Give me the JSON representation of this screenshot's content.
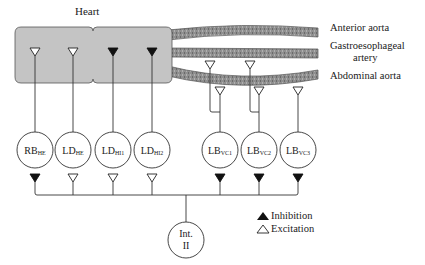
{
  "title": "Heart",
  "vessels": [
    {
      "name": "Anterior aorta",
      "y": 30
    },
    {
      "name": "Gastroesophageal",
      "name2": "artery",
      "y": 52
    },
    {
      "name": "Abdominal aorta",
      "y": 75
    }
  ],
  "heart_synapses": [
    {
      "x": 35,
      "type": "excitation"
    },
    {
      "x": 73,
      "type": "excitation"
    },
    {
      "x": 113,
      "type": "inhibition"
    },
    {
      "x": 152,
      "type": "inhibition"
    }
  ],
  "neurons": [
    {
      "id": "RB_HE",
      "main": "RB",
      "sub": "HE",
      "x": 35,
      "output": "inhibition"
    },
    {
      "id": "LD_HE",
      "main": "LD",
      "sub": "HE",
      "x": 73,
      "output": "excitation"
    },
    {
      "id": "LD_HI1",
      "main": "LD",
      "sub": "HI1",
      "x": 113,
      "output": "excitation"
    },
    {
      "id": "LD_HI2",
      "main": "LD",
      "sub": "HI2",
      "x": 152,
      "output": "excitation"
    },
    {
      "id": "LB_VC1",
      "main": "LB",
      "sub": "VC1",
      "x": 220,
      "output": "inhibition"
    },
    {
      "id": "LB_VC2",
      "main": "LB",
      "sub": "VC2",
      "x": 259,
      "output": "inhibition"
    },
    {
      "id": "LB_VC3",
      "main": "LB",
      "sub": "VC3",
      "x": 298,
      "output": "inhibition"
    }
  ],
  "interneuron": {
    "line1": "Int.",
    "line2": "II"
  },
  "legend": {
    "inhibition": "Inhibition",
    "excitation": "Excitation"
  },
  "colors": {
    "heart_fill": "#c8c8c8",
    "vessel_fill": "#8a8a8a",
    "line": "#333333"
  }
}
